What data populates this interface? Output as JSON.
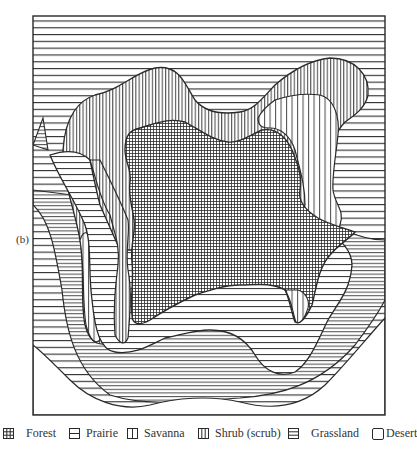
{
  "figure": {
    "panel_label": "(b)",
    "frame": {
      "left": 33,
      "top": 16,
      "right": 385,
      "bottom": 415
    }
  },
  "zones": [
    {
      "id": "forest",
      "label": "Forest",
      "pattern": "crosshatch-fine",
      "description": "central core"
    },
    {
      "id": "prairie",
      "label": "Prairie",
      "pattern": "horizontal-wide",
      "description": "narrow band around forest"
    },
    {
      "id": "savanna",
      "label": "Savanna",
      "pattern": "vertical-wide",
      "description": "patches between shrub and forest"
    },
    {
      "id": "shrub",
      "label": "Shrub (scrub)",
      "pattern": "vertical-fine",
      "description": "ring around forest/savanna"
    },
    {
      "id": "grassland",
      "label": "Grassland",
      "pattern": "horizontal-fine",
      "description": "outer area"
    },
    {
      "id": "desert",
      "label": "Desert",
      "pattern": "blank",
      "description": "bottom-right and bottom-left corners"
    }
  ],
  "legend": {
    "items": [
      {
        "label": "Forest",
        "icon": "crosshatch-square-icon"
      },
      {
        "label": "Prairie",
        "icon": "horizontal-split-square-icon"
      },
      {
        "label": "Savanna",
        "icon": "vertical-split-square-icon"
      },
      {
        "label": "Shrub (scrub)",
        "icon": "vertical-lines-square-icon"
      },
      {
        "label": "Grassland",
        "icon": "horizontal-lines-square-icon"
      },
      {
        "label": "Desert",
        "icon": "empty-square-icon"
      }
    ]
  },
  "colors": {
    "ink": "#2a2a2a",
    "paper": "#ffffff"
  }
}
